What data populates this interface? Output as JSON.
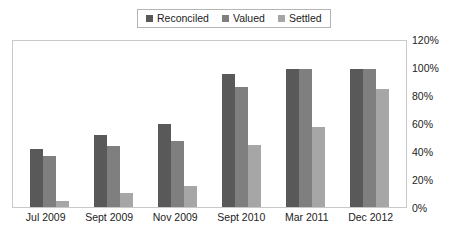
{
  "legend": {
    "position": "top-center",
    "boxed": true,
    "entries": [
      {
        "label": "Reconciled",
        "color": "#595959",
        "marker": "square-swatch"
      },
      {
        "label": "Valued",
        "color": "#7f7f7f",
        "marker": "square-swatch"
      },
      {
        "label": "Settled",
        "color": "#a6a6a6",
        "marker": "square-swatch"
      }
    ]
  },
  "axis": {
    "y_ticks": [
      "0%",
      "20%",
      "40%",
      "60%",
      "80%",
      "100%",
      "120%"
    ],
    "x_ticks": [
      "Jul 2009",
      "Sept 2009",
      "Nov 2009",
      "Sept 2010",
      "Mar 2011",
      "Dec 2012"
    ]
  },
  "chart_data": {
    "type": "bar",
    "title": "",
    "subtitle": "",
    "xlabel": "",
    "ylabel": "",
    "ylim": [
      0,
      120
    ],
    "ytick_step": 20,
    "ytick_format": "percent",
    "grid": false,
    "legend_position": "top-center",
    "categories": [
      "Jul 2009",
      "Sept 2009",
      "Nov 2009",
      "Sept 2010",
      "Mar 2011",
      "Dec 2012"
    ],
    "series": [
      {
        "name": "Reconciled",
        "color": "#595959",
        "values": [
          42,
          52,
          60,
          96,
          100,
          100
        ]
      },
      {
        "name": "Valued",
        "color": "#7f7f7f",
        "values": [
          37,
          44,
          48,
          87,
          100,
          100
        ]
      },
      {
        "name": "Settled",
        "color": "#a6a6a6",
        "values": [
          4,
          10,
          15,
          45,
          58,
          85
        ]
      }
    ]
  }
}
